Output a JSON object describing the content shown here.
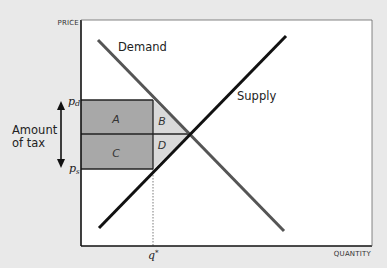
{
  "diagram": {
    "axes": {
      "y_label": "PRICE",
      "x_label": "QUANTITY"
    },
    "curves": {
      "demand_label": "Demand",
      "supply_label": "Supply"
    },
    "price_marks": {
      "pd": "p",
      "pd_sub": "d",
      "ps": "p",
      "ps_sub": "s"
    },
    "quantity_mark": {
      "q": "q",
      "q_sup": "*"
    },
    "areas": {
      "a": "A",
      "b": "B",
      "c": "C",
      "d": "D"
    },
    "tax_annotation": {
      "line1": "Amount",
      "line2": "of tax"
    },
    "colors": {
      "background": "#e9e9e9",
      "plot_bg": "#ffffff",
      "rect_fill": "#a8a8a8",
      "triangle_fill": "#d9d9d9",
      "demand_line": "#555555",
      "supply_line": "#111111"
    }
  }
}
